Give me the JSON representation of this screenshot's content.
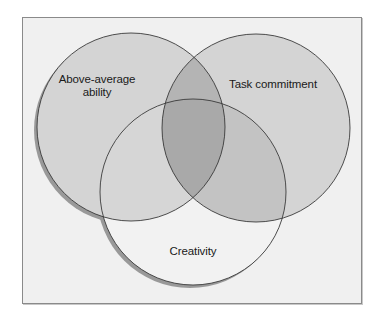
{
  "diagram": {
    "type": "venn",
    "sets": [
      {
        "id": "ability",
        "label_lines": [
          "Above-average",
          "ability"
        ]
      },
      {
        "id": "commitment",
        "label_lines": [
          "Task commitment"
        ]
      },
      {
        "id": "creativity",
        "label_lines": [
          "Creativity"
        ]
      }
    ]
  },
  "labels": {
    "ability_line1": "Above-average",
    "ability_line2": "ability",
    "commitment": "Task commitment",
    "creativity": "Creativity"
  },
  "colors": {
    "background": "#f0f0f0",
    "single_fill": "#d4d4d4",
    "creativity_only": "#f2f2f2",
    "ability_commitment_overlap": "#b4b4b4",
    "commitment_creativity_overlap": "#c3c3c3",
    "ability_creativity_overlap": "#d6d6d6",
    "triple_overlap": "#a9a9a9",
    "outline": "#3a3a3a",
    "shadow": "#999999",
    "frame_border": "#8a8a8a"
  }
}
